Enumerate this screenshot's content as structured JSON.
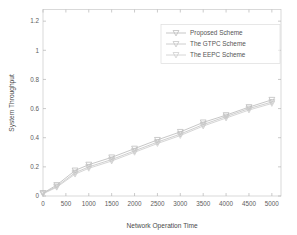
{
  "chart_data": {
    "type": "line",
    "title": "",
    "xlabel": "Network Operation Time",
    "ylabel": "System Throughput",
    "xlim": [
      0,
      5200
    ],
    "ylim": [
      0,
      1.28
    ],
    "xticks": [
      0,
      500,
      1000,
      1500,
      2000,
      2500,
      3000,
      3500,
      4000,
      4500,
      5000
    ],
    "xticklabels": [
      "0",
      "500",
      "1000",
      "1500",
      "2000",
      "2500",
      "3000",
      "3500",
      "4000",
      "4500",
      "5000"
    ],
    "yticks": [
      0,
      0.2,
      0.4,
      0.6,
      0.8,
      1,
      1.2
    ],
    "yticklabels": [
      "0",
      "0.2",
      "0.4",
      "0.6",
      "0.8",
      "1",
      "1.2"
    ],
    "grid": false,
    "box": true,
    "legend_position": "upper right",
    "marker": "v",
    "series": [
      {
        "name": "Proposed Scheme",
        "color": "#b9b9b9",
        "x": [
          0,
          300,
          700,
          1000,
          1500,
          2000,
          2500,
          3000,
          3500,
          4000,
          4500,
          5000
        ],
        "values": [
          0.02,
          0.075,
          0.175,
          0.215,
          0.265,
          0.325,
          0.385,
          0.44,
          0.505,
          0.555,
          0.61,
          0.66
        ]
      },
      {
        "name": "The GTPC Scheme",
        "color": "#c2c2c2",
        "x": [
          0,
          300,
          700,
          1000,
          1500,
          2000,
          2500,
          3000,
          3500,
          4000,
          4500,
          5000
        ],
        "values": [
          0.018,
          0.065,
          0.16,
          0.2,
          0.25,
          0.31,
          0.37,
          0.425,
          0.49,
          0.545,
          0.6,
          0.645
        ]
      },
      {
        "name": "The EEPC Scheme",
        "color": "#cbcbcb",
        "x": [
          0,
          300,
          700,
          1000,
          1500,
          2000,
          2500,
          3000,
          3500,
          4000,
          4500,
          5000
        ],
        "values": [
          0.015,
          0.06,
          0.15,
          0.19,
          0.24,
          0.3,
          0.36,
          0.415,
          0.48,
          0.535,
          0.59,
          0.635
        ]
      }
    ]
  },
  "legend": {
    "items": [
      {
        "label": "Proposed Scheme"
      },
      {
        "label": "The GTPC Scheme"
      },
      {
        "label": "The EEPC Scheme"
      }
    ]
  }
}
